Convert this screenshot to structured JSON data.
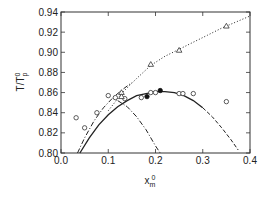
{
  "chart_data": {
    "type": "scatter",
    "title": "",
    "xlabel": "x",
    "xlabel_sub": "m",
    "xlabel_sup": "0",
    "ylabel": "T/T",
    "ylabel_sub": "p",
    "ylabel_sup": "0",
    "xlim": [
      0.0,
      0.4
    ],
    "ylim": [
      0.8,
      0.94
    ],
    "xticks": [
      "0.0",
      "0.1",
      "0.2",
      "0.3",
      "0.4"
    ],
    "xtick_values": [
      0.0,
      0.1,
      0.2,
      0.3,
      0.4
    ],
    "yticks": [
      "0.80",
      "0.82",
      "0.84",
      "0.86",
      "0.88",
      "0.90",
      "0.92",
      "0.94"
    ],
    "ytick_values": [
      0.8,
      0.82,
      0.84,
      0.86,
      0.88,
      0.9,
      0.92,
      0.94
    ],
    "grid": false,
    "series": [
      {
        "name": "open circles",
        "marker": "circle-open",
        "points": [
          [
            0.032,
            0.835
          ],
          [
            0.05,
            0.825
          ],
          [
            0.076,
            0.84
          ],
          [
            0.1,
            0.857
          ],
          [
            0.115,
            0.855
          ],
          [
            0.135,
            0.854
          ],
          [
            0.17,
            0.855
          ],
          [
            0.19,
            0.86
          ],
          [
            0.2,
            0.86
          ],
          [
            0.25,
            0.859
          ],
          [
            0.258,
            0.859
          ],
          [
            0.28,
            0.859
          ],
          [
            0.35,
            0.851
          ]
        ]
      },
      {
        "name": "filled circles",
        "marker": "circle-filled",
        "points": [
          [
            0.182,
            0.856
          ],
          [
            0.21,
            0.862
          ]
        ]
      },
      {
        "name": "open triangles",
        "marker": "triangle-open",
        "points": [
          [
            0.128,
            0.86
          ],
          [
            0.128,
            0.856
          ],
          [
            0.19,
            0.888
          ],
          [
            0.25,
            0.902
          ],
          [
            0.35,
            0.926
          ]
        ]
      }
    ],
    "curves": [
      {
        "name": "solid curve",
        "style": "solid",
        "points": [
          [
            0.04,
            0.8
          ],
          [
            0.06,
            0.815
          ],
          [
            0.08,
            0.828
          ],
          [
            0.1,
            0.838
          ],
          [
            0.12,
            0.846
          ],
          [
            0.14,
            0.852
          ],
          [
            0.16,
            0.857
          ],
          [
            0.18,
            0.859
          ],
          [
            0.2,
            0.861
          ],
          [
            0.22,
            0.861
          ],
          [
            0.24,
            0.86
          ],
          [
            0.26,
            0.857
          ],
          [
            0.28,
            0.852
          ],
          [
            0.3,
            0.845
          ]
        ]
      },
      {
        "name": "dashed curve",
        "style": "dashed",
        "points": [
          [
            0.3,
            0.845
          ],
          [
            0.32,
            0.836
          ],
          [
            0.34,
            0.825
          ],
          [
            0.36,
            0.813
          ],
          [
            0.375,
            0.803
          ]
        ]
      },
      {
        "name": "dash-dot curve rising",
        "style": "dashdot",
        "points": [
          [
            0.035,
            0.8
          ],
          [
            0.05,
            0.815
          ],
          [
            0.07,
            0.832
          ],
          [
            0.09,
            0.845
          ],
          [
            0.11,
            0.855
          ],
          [
            0.13,
            0.863
          ],
          [
            0.15,
            0.87
          ]
        ]
      },
      {
        "name": "dash-dot curve falling",
        "style": "dashdot",
        "points": [
          [
            0.12,
            0.852
          ],
          [
            0.14,
            0.846
          ],
          [
            0.16,
            0.836
          ],
          [
            0.18,
            0.823
          ],
          [
            0.2,
            0.807
          ],
          [
            0.21,
            0.8
          ]
        ]
      },
      {
        "name": "dotted curve",
        "style": "dotted",
        "points": [
          [
            0.1,
            0.842
          ],
          [
            0.13,
            0.86
          ],
          [
            0.16,
            0.874
          ],
          [
            0.19,
            0.887
          ],
          [
            0.22,
            0.896
          ],
          [
            0.25,
            0.903
          ],
          [
            0.28,
            0.91
          ],
          [
            0.31,
            0.917
          ],
          [
            0.34,
            0.924
          ],
          [
            0.37,
            0.93
          ],
          [
            0.4,
            0.936
          ]
        ]
      }
    ]
  }
}
